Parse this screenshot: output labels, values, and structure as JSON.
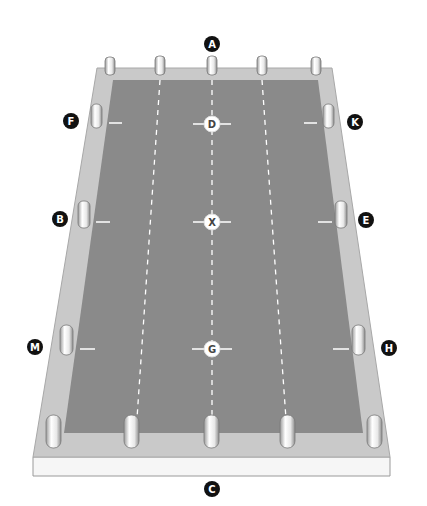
{
  "diagram": {
    "type": "perspective court layout",
    "colors": {
      "slab_top": "#c8c8c8",
      "slab_front": "#f4f4f4",
      "court": "#8a8a8a",
      "lines": "#ffffff",
      "label_dark_bg": "#111111",
      "label_light_bg": "#ffffff"
    },
    "outer_labels": [
      {
        "id": "A",
        "text": "A",
        "position": "top-center"
      },
      {
        "id": "F",
        "text": "F",
        "position": "upper-left"
      },
      {
        "id": "K",
        "text": "K",
        "position": "upper-right"
      },
      {
        "id": "B",
        "text": "B",
        "position": "middle-left"
      },
      {
        "id": "E",
        "text": "E",
        "position": "middle-right"
      },
      {
        "id": "M",
        "text": "M",
        "position": "lower-left"
      },
      {
        "id": "H",
        "text": "H",
        "position": "lower-right"
      },
      {
        "id": "C",
        "text": "C",
        "position": "bottom-center"
      }
    ],
    "center_markers": [
      {
        "id": "D",
        "text": "D",
        "position": "upper-center"
      },
      {
        "id": "X",
        "text": "X",
        "position": "center"
      },
      {
        "id": "G",
        "text": "G",
        "position": "lower-center"
      }
    ],
    "posts": {
      "top_row": 5,
      "bottom_row": 5,
      "left_side": 3,
      "right_side": 3
    }
  }
}
